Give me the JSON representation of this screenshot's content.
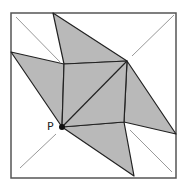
{
  "figure": {
    "point_label": "P",
    "colors": {
      "shade": "#b9b9b9",
      "stroke": "#222222",
      "guide": "#999999",
      "border": "#555555"
    },
    "outer_square": {
      "x": 11,
      "y": 13,
      "size": 165
    },
    "inner_square": [
      [
        64,
        64
      ],
      [
        127,
        61
      ],
      [
        124,
        122
      ],
      [
        62,
        127
      ]
    ],
    "petals": [
      [
        [
          53,
          13
        ],
        [
          127,
          61
        ],
        [
          64,
          64
        ]
      ],
      [
        [
          127,
          61
        ],
        [
          176,
          134
        ],
        [
          124,
          122
        ]
      ],
      [
        [
          124,
          122
        ],
        [
          134,
          176
        ],
        [
          62,
          127
        ]
      ],
      [
        [
          62,
          127
        ],
        [
          11,
          52
        ],
        [
          64,
          64
        ]
      ]
    ],
    "inner_diagonal": [
      [
        62,
        127
      ],
      [
        127,
        61
      ]
    ],
    "guide_lines": [
      [
        [
          16,
          17
        ],
        [
          60,
          62
        ]
      ],
      [
        [
          174,
          15
        ],
        [
          132,
          56
        ]
      ],
      [
        [
          130,
          130
        ],
        [
          172,
          172
        ]
      ],
      [
        [
          20,
          168
        ],
        [
          56,
          134
        ]
      ]
    ],
    "point_P": {
      "x": 62,
      "y": 127
    }
  }
}
